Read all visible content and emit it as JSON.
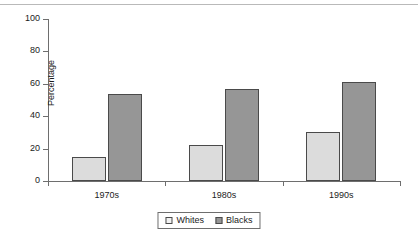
{
  "chart_data": {
    "type": "bar",
    "title": "",
    "xlabel": "",
    "ylabel": "Percentage",
    "categories": [
      "1970s",
      "1980s",
      "1990s"
    ],
    "series": [
      {
        "name": "Whites",
        "values": [
          15,
          22,
          30
        ],
        "color": "#dcdcdc"
      },
      {
        "name": "Blacks",
        "values": [
          54,
          57,
          61
        ],
        "color": "#969696"
      }
    ],
    "ylim": [
      0,
      100
    ],
    "yticks": [
      0,
      20,
      40,
      60,
      80,
      100
    ],
    "ytick_labels": [
      "0",
      "20",
      "40",
      "60",
      "80",
      "100"
    ],
    "grid": false,
    "legend_position": "bottom-center",
    "bar_outline_color": "#4a4a4a"
  }
}
